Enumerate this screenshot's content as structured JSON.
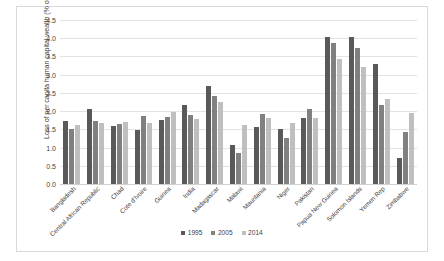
{
  "chart_data": {
    "type": "bar",
    "title": "",
    "xlabel": "",
    "ylabel": "Loss of per capita human capital wealth (% of total)",
    "ylim": [
      0.0,
      4.5
    ],
    "ytick_labels": [
      "4.5",
      "4.0",
      "3.5",
      "3.0",
      "2.5",
      "2.0",
      "1.5",
      "1.0",
      "0.5",
      "0.0"
    ],
    "ytick_values": [
      4.5,
      4.0,
      3.5,
      3.0,
      2.5,
      2.0,
      1.5,
      1.0,
      0.5,
      0.0
    ],
    "grid": true,
    "legend_position": "bottom",
    "categories": [
      "Bangladesh",
      "Central African Republic",
      "Chad",
      "Cote d'Ivoire",
      "Guinea",
      "India",
      "Madagascar",
      "Malawi",
      "Mauritania",
      "Niger",
      "Pakistan",
      "Papua New Guinea",
      "Solomon Islands",
      "Yemen Rep",
      "Zimbabwe"
    ],
    "series": [
      {
        "name": "1995",
        "color": "#595959",
        "values": [
          1.73,
          2.06,
          1.6,
          1.47,
          1.75,
          2.17,
          2.68,
          1.08,
          1.57,
          1.51,
          1.81,
          4.03,
          4.03,
          3.29,
          0.72
        ]
      },
      {
        "name": "2005",
        "color": "#808080",
        "values": [
          1.52,
          1.73,
          1.65,
          1.88,
          1.83,
          1.89,
          2.42,
          0.85,
          1.93,
          1.25,
          2.05,
          3.87,
          3.73,
          2.18,
          1.43
        ]
      },
      {
        "name": "2014",
        "color": "#bfbfbf",
        "values": [
          1.61,
          1.68,
          1.71,
          1.68,
          1.97,
          1.78,
          2.24,
          1.61,
          1.8,
          1.68,
          1.8,
          3.43,
          3.21,
          2.33,
          1.96
        ]
      }
    ]
  },
  "legend": {
    "items": [
      {
        "label": "1995"
      },
      {
        "label": "2005"
      },
      {
        "label": "2014"
      }
    ]
  }
}
